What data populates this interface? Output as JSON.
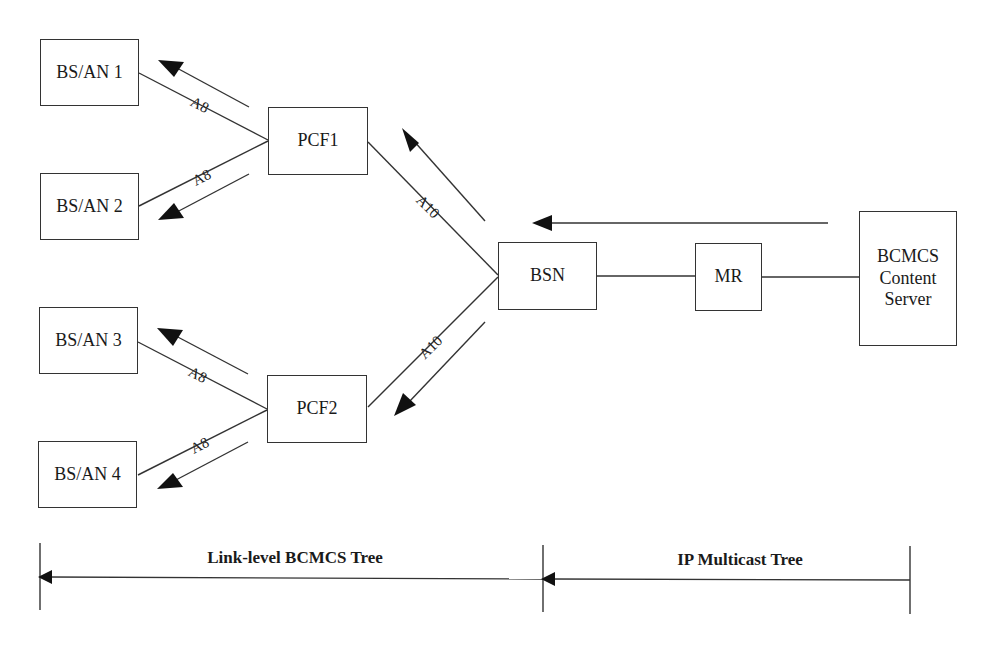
{
  "nodes": {
    "bsan1": "BS/AN 1",
    "bsan2": "BS/AN 2",
    "bsan3": "BS/AN 3",
    "bsan4": "BS/AN 4",
    "pcf1": "PCF1",
    "pcf2": "PCF2",
    "bsn": "BSN",
    "mr": "MR",
    "server_line1": "BCMCS",
    "server_line2": "Content",
    "server_line3": "Server"
  },
  "links": {
    "a8": "A8",
    "a10": "A10"
  },
  "trees": {
    "link_level": "Link-level BCMCS Tree",
    "ip_multicast": "IP Multicast Tree"
  }
}
